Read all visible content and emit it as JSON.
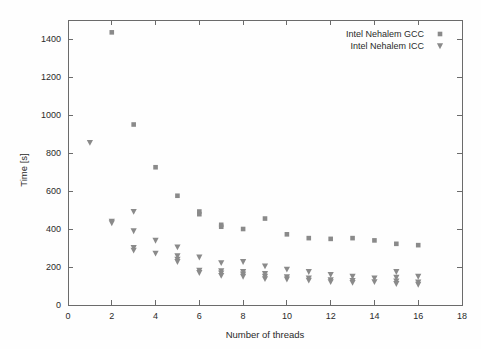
{
  "chart_data": {
    "type": "scatter",
    "title": "",
    "xlabel": "Number of threads",
    "ylabel": "Time [s]",
    "xlim": [
      0,
      18
    ],
    "ylim": [
      0,
      1500
    ],
    "xticks": [
      0,
      2,
      4,
      6,
      8,
      10,
      12,
      14,
      16,
      18
    ],
    "yticks": [
      0,
      200,
      400,
      600,
      800,
      1000,
      1200,
      1400
    ],
    "grid": false,
    "legend_position": "top-right",
    "marker_color": "#8a8a8a",
    "axis_color": "#6b6b6b",
    "series": [
      {
        "name": "Intel Nehalem GCC",
        "marker": "square",
        "points": [
          [
            2,
            1435
          ],
          [
            3,
            950
          ],
          [
            4,
            725
          ],
          [
            5,
            575
          ],
          [
            6,
            492
          ],
          [
            6,
            478
          ],
          [
            7,
            422
          ],
          [
            7,
            412
          ],
          [
            8,
            400
          ],
          [
            9,
            455
          ],
          [
            10,
            372
          ],
          [
            11,
            352
          ],
          [
            12,
            348
          ],
          [
            13,
            352
          ],
          [
            14,
            340
          ],
          [
            15,
            322
          ],
          [
            16,
            315
          ]
        ]
      },
      {
        "name": "Intel Nehalem ICC",
        "marker": "triangle-down",
        "points": [
          [
            1,
            855
          ],
          [
            2,
            440
          ],
          [
            2,
            432
          ],
          [
            3,
            492
          ],
          [
            3,
            390
          ],
          [
            3,
            302
          ],
          [
            3,
            288
          ],
          [
            4,
            340
          ],
          [
            4,
            272
          ],
          [
            5,
            305
          ],
          [
            5,
            258
          ],
          [
            5,
            240
          ],
          [
            5,
            228
          ],
          [
            6,
            252
          ],
          [
            6,
            182
          ],
          [
            6,
            170
          ],
          [
            7,
            222
          ],
          [
            7,
            180
          ],
          [
            7,
            168
          ],
          [
            7,
            155
          ],
          [
            8,
            228
          ],
          [
            8,
            175
          ],
          [
            8,
            162
          ],
          [
            8,
            150
          ],
          [
            9,
            205
          ],
          [
            9,
            165
          ],
          [
            9,
            150
          ],
          [
            9,
            138
          ],
          [
            10,
            188
          ],
          [
            10,
            148
          ],
          [
            10,
            136
          ],
          [
            11,
            175
          ],
          [
            11,
            142
          ],
          [
            11,
            130
          ],
          [
            12,
            160
          ],
          [
            12,
            132
          ],
          [
            12,
            122
          ],
          [
            13,
            150
          ],
          [
            13,
            128
          ],
          [
            13,
            118
          ],
          [
            14,
            142
          ],
          [
            14,
            122
          ],
          [
            15,
            175
          ],
          [
            15,
            145
          ],
          [
            15,
            125
          ],
          [
            15,
            112
          ],
          [
            16,
            150
          ],
          [
            16,
            120
          ],
          [
            16,
            108
          ]
        ]
      }
    ]
  },
  "legend": {
    "entries": [
      {
        "label": "Intel Nehalem GCC",
        "marker": "square"
      },
      {
        "label": "Intel Nehalem ICC",
        "marker": "triangle-down"
      }
    ]
  },
  "axes": {
    "y_title": "Time [s]",
    "x_title": "Number of threads"
  }
}
